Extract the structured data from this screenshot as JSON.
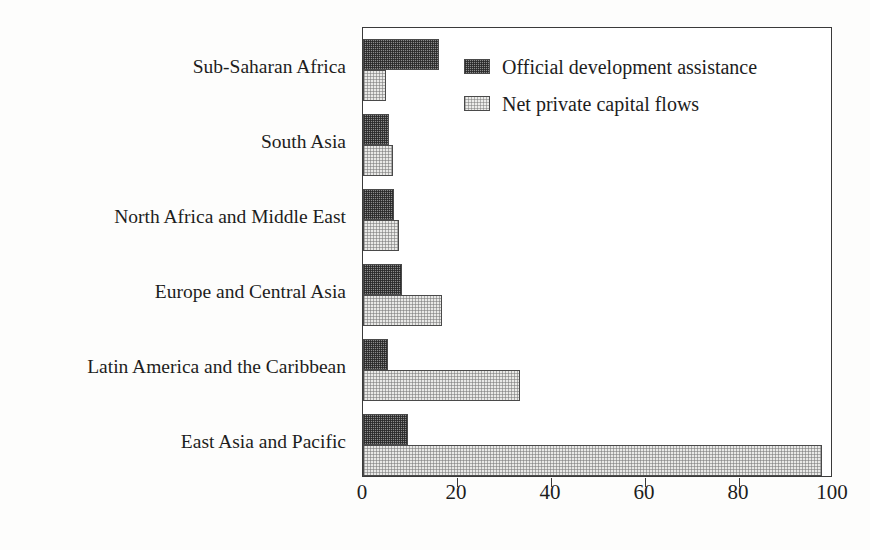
{
  "chart_data": {
    "type": "bar",
    "orientation": "horizontal",
    "title": "",
    "subtitle": "",
    "xlabel": "",
    "ylabel": "",
    "xlim": [
      0,
      100
    ],
    "xticks": [
      0,
      20,
      40,
      60,
      80,
      100
    ],
    "xtick_labels": [
      "0",
      "20",
      "40",
      "60",
      "80",
      "100"
    ],
    "grid": false,
    "legend_position": "top-right-inside",
    "categories": [
      "Sub-Saharan Africa",
      "South Asia",
      "North Africa and Middle East",
      "Europe and Central Asia",
      "Latin America and the Caribbean",
      "East Asia and Pacific"
    ],
    "series": [
      {
        "name": "Official development assistance",
        "swatch": "dark",
        "color": "#8c8c8c",
        "values": [
          16.1,
          5.5,
          6.6,
          8.3,
          5.3,
          9.6
        ]
      },
      {
        "name": "Net private capital flows",
        "swatch": "light",
        "color": "#e9e9e7",
        "values": [
          4.9,
          6.4,
          7.6,
          16.8,
          33.5,
          97.7
        ]
      }
    ]
  },
  "legend": {
    "items": [
      {
        "label": "Official development assistance",
        "swatch": "dark"
      },
      {
        "label": "Net private capital flows",
        "swatch": "light"
      }
    ]
  },
  "colors": {
    "frame": "#3a3a3a",
    "text": "#1d1d1d",
    "background": "#fdfdfc",
    "series_dark": "#8c8c8c",
    "series_light": "#e9e9e7"
  }
}
